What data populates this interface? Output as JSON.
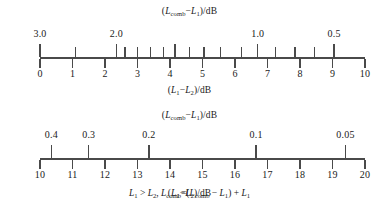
{
  "figure": {
    "formula": "L₁ > L₂, Lₘ = (Lₘ − L₁) + L₁",
    "formula_parts": {
      "lhs_a": "L",
      "lhs_a_sub": "1",
      "gt": " > ",
      "lhs_b": "L",
      "lhs_b_sub": "2",
      "comma": ", ",
      "comb": "L",
      "comb_sub": "comb",
      "eq": "=(",
      "comb2": "L",
      "comb2_sub": "comb",
      "minus": " − ",
      "l1": "L",
      "l1_sub": "1",
      "close": ") + ",
      "l1b": "L",
      "l1b_sub": "1"
    }
  },
  "chart_data": {
    "type": "table",
    "grid": false,
    "legend": null,
    "scales": [
      {
        "id": "upper",
        "top_label": {
          "pre": "(",
          "sym1": "L",
          "sym1_sub": "comb",
          "minus": "−",
          "sym2": "L",
          "sym2_sub": "1",
          "post": ")/dB"
        },
        "bottom_label": {
          "pre": "(",
          "sym1": "L",
          "sym1_sub": "1",
          "minus": "−",
          "sym2": "L",
          "sym2_sub": "2",
          "post": ")/dB"
        },
        "xlabel": "(L1 - L2)/dB",
        "ylabel": "(Lcomb - L1)/dB",
        "xlim": [
          0,
          10
        ],
        "bottom_ticks": [
          {
            "value": 0,
            "label": "0"
          },
          {
            "value": 1,
            "label": "1"
          },
          {
            "value": 2,
            "label": "2"
          },
          {
            "value": 3,
            "label": "3"
          },
          {
            "value": 4,
            "label": "4"
          },
          {
            "value": 5,
            "label": "5"
          },
          {
            "value": 6,
            "label": "6"
          },
          {
            "value": 7,
            "label": "7"
          },
          {
            "value": 8,
            "label": "8"
          },
          {
            "value": 9,
            "label": "9"
          },
          {
            "value": 10,
            "label": "10"
          }
        ],
        "top_ticks": [
          {
            "x": 0.0,
            "label": "3.0",
            "major": true
          },
          {
            "x": 1.1,
            "label": "",
            "major": false
          },
          {
            "x": 2.35,
            "label": "2.0",
            "major": true
          },
          {
            "x": 2.62,
            "label": "",
            "major": false
          },
          {
            "x": 3.0,
            "label": "",
            "major": false
          },
          {
            "x": 3.4,
            "label": "",
            "major": false
          },
          {
            "x": 3.8,
            "label": "",
            "major": false
          },
          {
            "x": 4.15,
            "label": "",
            "major": true
          },
          {
            "x": 4.6,
            "label": "",
            "major": false
          },
          {
            "x": 5.05,
            "label": "",
            "major": false
          },
          {
            "x": 5.55,
            "label": "",
            "major": false
          },
          {
            "x": 6.2,
            "label": "",
            "major": false
          },
          {
            "x": 6.7,
            "label": "1.0",
            "major": true
          },
          {
            "x": 7.25,
            "label": "",
            "major": false
          },
          {
            "x": 7.85,
            "label": "",
            "major": false
          },
          {
            "x": 8.45,
            "label": "",
            "major": false
          },
          {
            "x": 9.05,
            "label": "0.5",
            "major": true
          }
        ]
      },
      {
        "id": "lower",
        "top_label": {
          "pre": "(",
          "sym1": "L",
          "sym1_sub": "comb",
          "minus": "−",
          "sym2": "L",
          "sym2_sub": "1",
          "post": ")/dB"
        },
        "bottom_label": {
          "pre": "(",
          "sym1": "L",
          "sym1_sub": "1",
          "minus": "−",
          "sym2": "L",
          "sym2_sub": "2",
          "post": ")/dB"
        },
        "xlabel": "(L1 - L2)/dB",
        "ylabel": "(Lcomb - L1)/dB",
        "xlim": [
          10,
          20
        ],
        "bottom_ticks": [
          {
            "value": 10,
            "label": "10"
          },
          {
            "value": 11,
            "label": "11"
          },
          {
            "value": 12,
            "label": "12"
          },
          {
            "value": 13,
            "label": "13"
          },
          {
            "value": 14,
            "label": "14"
          },
          {
            "value": 15,
            "label": "15"
          },
          {
            "value": 16,
            "label": "16"
          },
          {
            "value": 17,
            "label": "17"
          },
          {
            "value": 18,
            "label": "18"
          },
          {
            "value": 19,
            "label": "19"
          },
          {
            "value": 20,
            "label": "20"
          }
        ],
        "top_ticks": [
          {
            "x": 10.35,
            "label": "0.4",
            "major": true
          },
          {
            "x": 11.5,
            "label": "0.3",
            "major": true
          },
          {
            "x": 13.35,
            "label": "0.2",
            "major": true
          },
          {
            "x": 16.65,
            "label": "0.1",
            "major": true
          },
          {
            "x": 19.4,
            "label": "0.05",
            "major": true
          }
        ]
      }
    ]
  }
}
